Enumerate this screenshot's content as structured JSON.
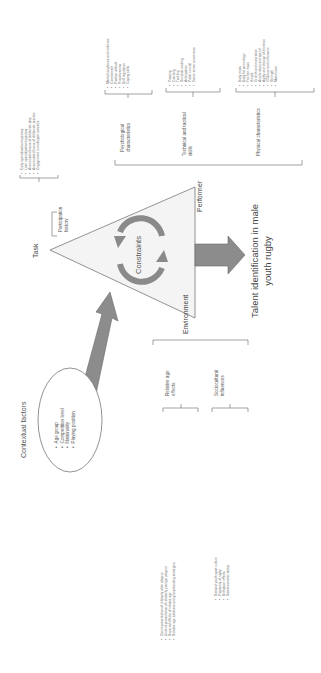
{
  "diagram": {
    "center_label": "Constraints",
    "vertices": {
      "task": "Task",
      "performer": "Performer",
      "environment": "Environment"
    },
    "outcome": {
      "line1": "Talent identification in male",
      "line2": "youth rugby"
    },
    "contextual_factors": {
      "title": "Contextual factors",
      "items": [
        "Age group",
        "Competition level",
        "Nationality",
        "Playing position"
      ]
    },
    "task_branch": {
      "category": "Participation history",
      "category_line1": "Participation",
      "category_line2": "history",
      "items": [
        "Early specialisation trajectory",
        "Later specialisation trajectory",
        "Accumulated hours of deliberate play",
        "Accumulated hours of deliberate practice",
        "Engagement in multisport activities"
      ]
    },
    "performer_branch": {
      "psychological": {
        "line1": "Psychological",
        "line2": "characteristics",
        "items": [
          "Mental toughness and resilience",
          "Commitment",
          "Positive attitude",
          "Proactiveness",
          "Self-regulation",
          "Coping skills"
        ]
      },
      "technical": {
        "line1": "Technical and tactical",
        "line2": "skills",
        "items": [
          "Passing",
          "Catching",
          "Tackling",
          "Decision-making",
          "Anticipation",
          "Pattern recall",
          "Game sense awareness"
        ]
      },
      "physical": {
        "line1": "Physical characteristics",
        "items": [
          "Body mass",
          "Body fat percentage",
          "Fat-free mass",
          "Height",
          "Growth and maturation",
          "Acceleration and speed",
          "Agility and change of direction",
          "VO2max and endurance",
          "Strength",
          "Momentum"
        ]
      }
    },
    "environment_branch": {
      "relative_age": {
        "line1": "Relative age",
        "line2": "effects",
        "items": [
          "Overrepresentation of relatively older players",
          "Underrepresentation of relatively younger players",
          "Reversal effects of relative age",
          "Relative age solutions and group banding strategies"
        ]
      },
      "sociocultural": {
        "line1": "Sociocultural",
        "line2": "influences",
        "items": [
          "National youth sport culture",
          "Popularity of rugby",
          "Birthplace effects",
          "Socioeconomic status"
        ]
      }
    },
    "colors": {
      "triangle_fill": "#f2f2f2",
      "arrow_fill": "#8c8c8c",
      "arrow_stroke": "#6f6f6f",
      "cycle_fill": "#7a7a7a",
      "line": "#555555"
    }
  }
}
